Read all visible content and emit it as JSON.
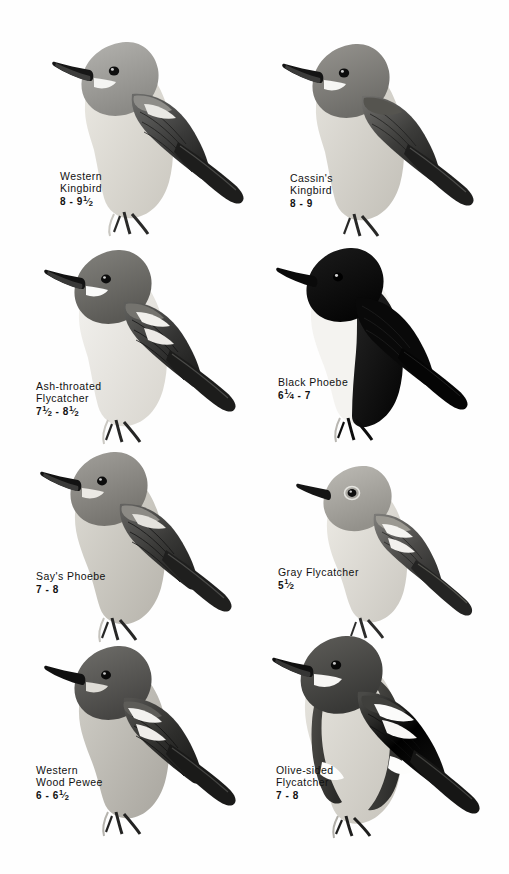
{
  "page": {
    "type": "field-guide-plate",
    "background_color": "#fefefe",
    "ink_color": "#111111",
    "columns": 2,
    "rows": 4,
    "total_species": 8
  },
  "species": [
    {
      "name_line1": "Western",
      "name_line2": "Kingbird",
      "size_text": "8 - 9½",
      "size_whole_low": "8",
      "size_low_frac": "",
      "size_whole_high": "9",
      "size_high_frac": "1/2",
      "plumage": "gray head and breast, pale yellow belly, blackish wings, long black tail",
      "tone_head": "#9a9a9a",
      "tone_body": "#d8d6d0",
      "tone_wing": "#3a3a3a",
      "tone_tail": "#1d1d1d"
    },
    {
      "name_line1": "Cassin's",
      "name_line2": "Kingbird",
      "size_text": "8 - 9",
      "size_whole_low": "8",
      "size_low_frac": "",
      "size_whole_high": "9",
      "size_high_frac": "",
      "plumage": "dark gray head, white chin, gray breast, dusky wings, dark tail",
      "tone_head": "#7e7e7e",
      "tone_body": "#cfccc6",
      "tone_wing": "#3e3e3e",
      "tone_tail": "#222222"
    },
    {
      "name_line1": "Ash-throated",
      "name_line2": "Flycatcher",
      "size_text": "7½ - 8½",
      "size_whole_low": "7",
      "size_low_frac": "1/2",
      "size_whole_high": "8",
      "size_high_frac": "1/2",
      "plumage": "gray-brown head, whitish throat, pale belly, rufous-edged wings and tail",
      "tone_head": "#6f6f6f",
      "tone_body": "#ebe9e4",
      "tone_wing": "#4a4a4a",
      "tone_tail": "#2b2b2b"
    },
    {
      "name_line1": "Black Phoebe",
      "name_line2": "",
      "size_text": "6¼ - 7",
      "size_whole_low": "6",
      "size_low_frac": "1/4",
      "size_whole_high": "7",
      "size_high_frac": "",
      "plumage": "sooty black head, breast and upperparts with sharply contrasting white belly",
      "tone_head": "#0d0d0d",
      "tone_body": "#f2f1ee",
      "tone_wing": "#0d0d0d",
      "tone_tail": "#070707"
    },
    {
      "name_line1": "Say's Phoebe",
      "name_line2": "",
      "size_text": "7 - 8",
      "size_whole_low": "7",
      "size_low_frac": "",
      "size_whole_high": "8",
      "size_high_frac": "",
      "plumage": "brownish gray head and back, pale cinnamon belly, blackish tail",
      "tone_head": "#8b8a86",
      "tone_body": "#c8c5bd",
      "tone_wing": "#4f4f4f",
      "tone_tail": "#262626"
    },
    {
      "name_line1": "Gray Flycatcher",
      "name_line2": "",
      "size_text": "5½",
      "size_whole_low": "5",
      "size_low_frac": "1/2",
      "size_whole_high": "",
      "size_high_frac": "",
      "plumage": "pale gray overall, whitish eye-ring, two pale wing bars, dark tail",
      "tone_head": "#a9a7a1",
      "tone_body": "#dddbd5",
      "tone_wing": "#5a5a58",
      "tone_tail": "#2e2e2e"
    },
    {
      "name_line1": "Western",
      "name_line2": "Wood Pewee",
      "size_text": "6 - 6½",
      "size_whole_low": "6",
      "size_low_frac": "",
      "size_whole_high": "6",
      "size_high_frac": "1/2",
      "plumage": "dark gray-brown above, dusky breast, faint wing bars, dark tail",
      "tone_head": "#5d5c59",
      "tone_body": "#bfbdb6",
      "tone_wing": "#3a3a38",
      "tone_tail": "#1f1f1f"
    },
    {
      "name_line1": "Olive-sided",
      "name_line2": "Flycatcher",
      "size_text": "7 - 8",
      "size_whole_low": "7",
      "size_low_frac": "",
      "size_whole_high": "8",
      "size_high_frac": "",
      "plumage": "dark olive sides forming vest against white central stripe, white flank tufts",
      "tone_head": "#4a4a47",
      "tone_body": "#d6d4cd",
      "tone_wing": "#2c2c2a",
      "tone_tail": "#1a1a1a"
    }
  ]
}
